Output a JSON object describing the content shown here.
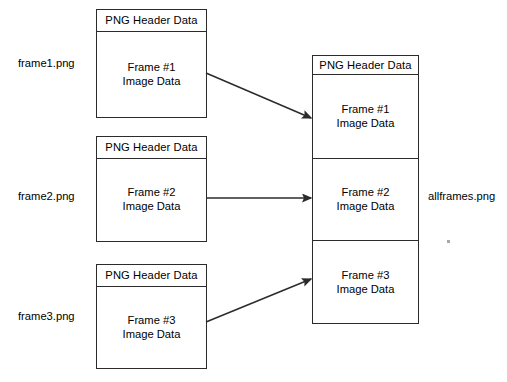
{
  "diagram": {
    "stroke_color": "#2b2b2b",
    "background_color": "#ffffff",
    "header_label": "PNG Header Data",
    "sources": [
      {
        "file_label": "frame1.png",
        "header": "PNG Header Data",
        "body_line1": "Frame #1",
        "body_line2": "Image Data"
      },
      {
        "file_label": "frame2.png",
        "header": "PNG Header Data",
        "body_line1": "Frame #2",
        "body_line2": "Image Data"
      },
      {
        "file_label": "frame3.png",
        "header": "PNG Header Data",
        "body_line1": "Frame #3",
        "body_line2": "Image Data"
      }
    ],
    "destination": {
      "file_label": "allframes.png",
      "header": "PNG Header Data",
      "sections": [
        {
          "line1": "Frame #1",
          "line2": "Image Data"
        },
        {
          "line1": "Frame #2",
          "line2": "Image Data"
        },
        {
          "line1": "Frame #3",
          "line2": "Image Data"
        }
      ]
    },
    "arrows": [
      {
        "name": "arrow-frame1-to-dest",
        "from_x": 206,
        "from_y": 73,
        "to_x": 311,
        "to_y": 118
      },
      {
        "name": "arrow-frame2-to-dest",
        "from_x": 206,
        "from_y": 198,
        "to_x": 311,
        "to_y": 198
      },
      {
        "name": "arrow-frame3-to-dest",
        "from_x": 206,
        "from_y": 322,
        "to_x": 311,
        "to_y": 279
      }
    ]
  }
}
